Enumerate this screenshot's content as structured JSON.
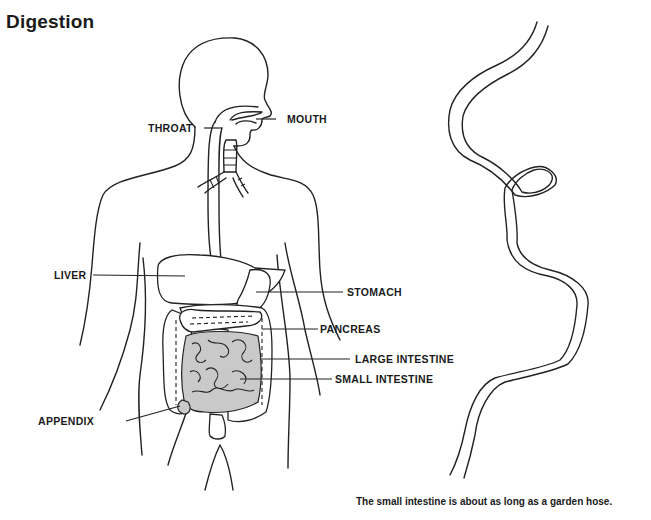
{
  "title": "Digestion",
  "labels": {
    "mouth": "MOUTH",
    "throat": "THROAT",
    "liver": "LIVER",
    "stomach": "STOMACH",
    "pancreas": "PANCREAS",
    "large_intestine": "LARGE INTESTINE",
    "small_intestine": "SMALL INTESTINE",
    "appendix": "APPENDIX"
  },
  "caption": "The small intestine is about as long as a garden hose.",
  "colors": {
    "line": "#222222",
    "intestine_fill": "#c9c9c9",
    "background": "#ffffff"
  }
}
